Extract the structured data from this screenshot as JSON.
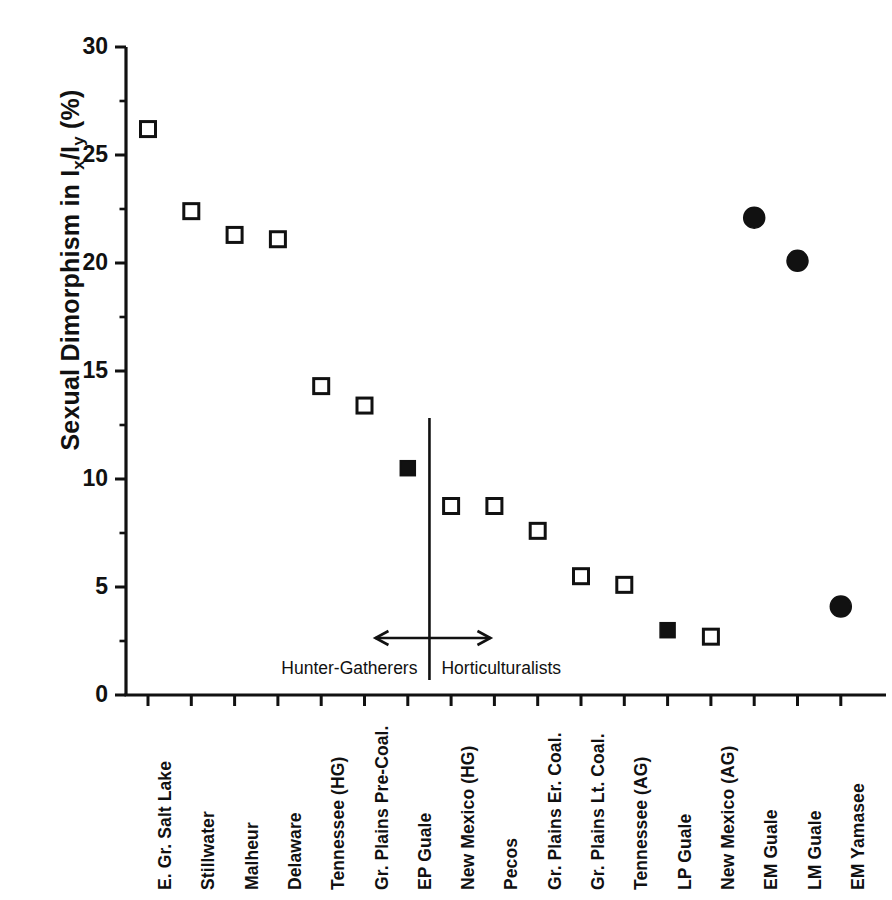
{
  "chart_data": {
    "type": "scatter",
    "title": "",
    "xlabel": "",
    "ylabel": "Sexual Dimorphism in Ix/Iy (%)",
    "ylabel_parts": {
      "prefix": "Sexual Dimorphism in I",
      "sub1": "x",
      "mid": "/I",
      "sub2": "y",
      "suffix": " (%)"
    },
    "ylim": [
      0,
      30
    ],
    "yticks": [
      0,
      5,
      10,
      15,
      20,
      25,
      30
    ],
    "ytick_labels": [
      "0",
      "5",
      "10",
      "15",
      "20",
      "25",
      "30"
    ],
    "yminor_interval": 2.5,
    "grid": false,
    "legend": "none",
    "categories": [
      "E. Gr. Salt Lake",
      "Stillwater",
      "Malheur",
      "Delaware",
      "Tennessee (HG)",
      "Gr. Plains  Pre-Coal.",
      "EP Guale",
      "New Mexico (HG)",
      "Pecos",
      "Gr. Plains Er. Coal.",
      "Gr. Plains Lt. Coal.",
      "Tennessee (AG)",
      "LP Guale",
      "New Mexico (AG)",
      "EM Guale",
      "LM Guale",
      "EM Yamasee"
    ],
    "points": [
      {
        "label": "E. Gr. Salt Lake",
        "tick": 1,
        "value": 26.2,
        "marker": "open-square"
      },
      {
        "label": "Stillwater",
        "tick": 2,
        "value": 22.4,
        "marker": "open-square"
      },
      {
        "label": "Malheur",
        "tick": 3,
        "value": 21.3,
        "marker": "open-square"
      },
      {
        "label": "Delaware",
        "tick": 4,
        "value": 21.1,
        "marker": "open-square"
      },
      {
        "label": "Tennessee (HG)",
        "tick": 5,
        "value": 14.3,
        "marker": "open-square"
      },
      {
        "label": "Gr. Plains  Pre-Coal.",
        "tick": 6,
        "value": 13.4,
        "marker": "open-square"
      },
      {
        "label": "EP Guale",
        "tick": 7,
        "value": 10.5,
        "marker": "filled-square"
      },
      {
        "label": "New Mexico (HG)",
        "tick": 8,
        "value": 8.75,
        "marker": "open-square"
      },
      {
        "label": "Pecos",
        "tick": 9,
        "value": 8.75,
        "marker": "open-square"
      },
      {
        "label": "Gr. Plains Er. Coal.",
        "tick": 10,
        "value": 7.6,
        "marker": "open-square"
      },
      {
        "label": "Gr. Plains Lt. Coal.",
        "tick": 11,
        "value": 5.5,
        "marker": "open-square"
      },
      {
        "label": "Tennessee (AG)",
        "tick": 12,
        "value": 5.1,
        "marker": "open-square"
      },
      {
        "label": "LP Guale",
        "tick": 13,
        "value": 3.0,
        "marker": "filled-square"
      },
      {
        "label": "New Mexico (AG)",
        "tick": 14,
        "value": 2.7,
        "marker": "open-square"
      },
      {
        "label": "EM Guale",
        "tick": 15,
        "value": 22.1,
        "marker": "filled-circle"
      },
      {
        "label": "LM Guale",
        "tick": 16,
        "value": 20.1,
        "marker": "filled-circle"
      },
      {
        "label": "EM Yamasee",
        "tick": 17,
        "value": 4.1,
        "marker": "filled-circle"
      }
    ],
    "annotations": {
      "divider_at_tick": 7.5,
      "divider_label_left": "Hunter-Gatherers",
      "divider_label_right": "Horticulturalists",
      "arrow": "double-headed-horizontal"
    },
    "colors": {
      "axis": "#111111",
      "marker_edge": "#111111",
      "marker_fill_open": "#ffffff",
      "marker_fill_closed": "#111111",
      "background": "#ffffff"
    }
  }
}
